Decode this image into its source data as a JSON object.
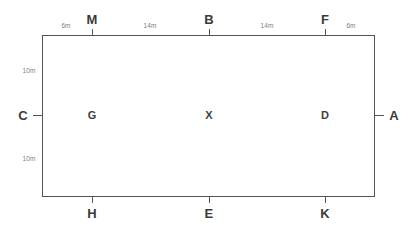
{
  "figure": {
    "type": "survey-site-plan",
    "shape": "rectangle",
    "background_color": "#ffffff",
    "stroke_color": "#555555",
    "label_color": "#3a3a3a",
    "dimension_color": "#7d7d7d"
  },
  "rect": {
    "x": 42,
    "y": 35,
    "width": 333,
    "height": 162
  },
  "top_points": [
    {
      "id": "point-m",
      "label": "M",
      "x": 92,
      "label_y": 19,
      "tick_from": 35,
      "tick_to": 29
    },
    {
      "id": "point-b",
      "label": "B",
      "x": 209,
      "label_y": 19,
      "tick_from": 35,
      "tick_to": 29
    },
    {
      "id": "point-f",
      "label": "F",
      "x": 325,
      "label_y": 19,
      "tick_from": 35,
      "tick_to": 29
    }
  ],
  "bottom_points": [
    {
      "id": "point-h",
      "label": "H",
      "x": 92,
      "label_y": 213,
      "tick_from": 197,
      "tick_to": 203
    },
    {
      "id": "point-e",
      "label": "E",
      "x": 209,
      "label_y": 213,
      "tick_from": 197,
      "tick_to": 203
    },
    {
      "id": "point-k",
      "label": "K",
      "x": 325,
      "label_y": 213,
      "tick_from": 197,
      "tick_to": 203
    }
  ],
  "side_points": [
    {
      "id": "point-c",
      "label": "C",
      "side": "left",
      "y": 115,
      "label_x": 23,
      "tick_from": 42,
      "tick_to": 33
    },
    {
      "id": "point-a",
      "label": "A",
      "side": "right",
      "y": 115,
      "label_x": 394,
      "tick_from": 375,
      "tick_to": 384
    }
  ],
  "interior_points": [
    {
      "id": "point-g",
      "label": "G",
      "x": 92,
      "y": 115
    },
    {
      "id": "point-x",
      "label": "X",
      "x": 209,
      "y": 115
    },
    {
      "id": "point-d",
      "label": "D",
      "x": 325,
      "y": 115
    }
  ],
  "dimensions_top": [
    {
      "id": "dim-corner-to-m",
      "label": "6m",
      "x": 66,
      "y": 25,
      "from": "top-left-corner",
      "to": "M"
    },
    {
      "id": "dim-m-to-b",
      "label": "14m",
      "x": 150,
      "y": 25,
      "from": "M",
      "to": "B"
    },
    {
      "id": "dim-b-to-f",
      "label": "14m",
      "x": 267,
      "y": 25,
      "from": "B",
      "to": "F"
    },
    {
      "id": "dim-f-to-corner",
      "label": "6m",
      "x": 351,
      "y": 25,
      "from": "F",
      "to": "top-right-corner"
    }
  ],
  "dimensions_left": [
    {
      "id": "dim-top-to-c",
      "label": "10m",
      "x": 29,
      "y": 70,
      "from": "top-left-corner",
      "to": "C"
    },
    {
      "id": "dim-c-to-bottom",
      "label": "10m",
      "x": 29,
      "y": 158,
      "from": "C",
      "to": "bottom-left-corner"
    }
  ]
}
